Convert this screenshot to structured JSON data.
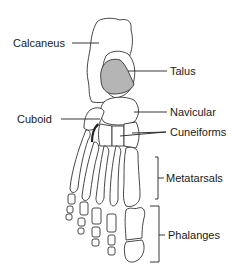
{
  "diagram": {
    "labels": {
      "calcaneus": "Calcaneus",
      "talus": "Talus",
      "cuboid": "Cuboid",
      "navicular": "Navicular",
      "cuneiforms": "Cuneiforms",
      "metatarsals": "Metatarsals",
      "phalanges": "Phalanges"
    },
    "colors": {
      "talus_fill": "#b5b5b5",
      "outline": "#333333",
      "background": "#ffffff"
    }
  }
}
